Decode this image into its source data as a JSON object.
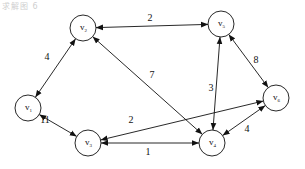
{
  "diagram": {
    "type": "weighted-graph",
    "caption": "求解图 6",
    "colors": {
      "stroke": "#111111",
      "background": "#ffffff"
    },
    "nodes": [
      {
        "id": "v1",
        "label": "v",
        "sub": "1",
        "x": 28,
        "y": 108
      },
      {
        "id": "v2",
        "label": "v",
        "sub": "2",
        "x": 83,
        "y": 28
      },
      {
        "id": "v3",
        "label": "v",
        "sub": "3",
        "x": 88,
        "y": 143
      },
      {
        "id": "v4",
        "label": "v",
        "sub": "4",
        "x": 212,
        "y": 143
      },
      {
        "id": "v5",
        "label": "v",
        "sub": "5",
        "x": 221,
        "y": 24
      },
      {
        "id": "v6",
        "label": "v",
        "sub": "6",
        "x": 276,
        "y": 98
      }
    ],
    "edges": [
      {
        "from": "v1",
        "to": "v2",
        "weight": "4",
        "directed": "both",
        "lx": 47,
        "ly": 60
      },
      {
        "from": "v2",
        "to": "v5",
        "weight": "2",
        "directed": "both",
        "lx": 150,
        "ly": 21
      },
      {
        "from": "v1",
        "to": "v3",
        "weight": "11",
        "directed": "both",
        "lx": 45,
        "ly": 123
      },
      {
        "from": "v2",
        "to": "v4",
        "weight": "7",
        "directed": "both",
        "lx": 152,
        "ly": 78
      },
      {
        "from": "v5",
        "to": "v4",
        "weight": "3",
        "directed": "both",
        "lx": 211,
        "ly": 91
      },
      {
        "from": "v5",
        "to": "v6",
        "weight": "8",
        "directed": "both",
        "lx": 256,
        "ly": 63
      },
      {
        "from": "v3",
        "to": "v6",
        "weight": "2",
        "directed": "both",
        "lx": 131,
        "ly": 123
      },
      {
        "from": "v3",
        "to": "v4",
        "weight": "1",
        "directed": "both",
        "lx": 148,
        "ly": 155
      },
      {
        "from": "v6",
        "to": "v4",
        "weight": "4",
        "directed": "both",
        "lx": 247,
        "ly": 132
      }
    ]
  }
}
